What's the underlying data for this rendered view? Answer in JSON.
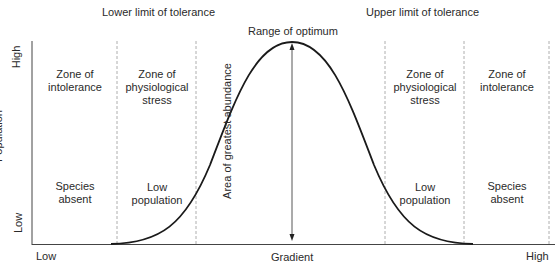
{
  "chart_data": {
    "type": "line",
    "title": "",
    "xlabel": "Gradient",
    "ylabel": "Population",
    "x_ticks": [
      "Low",
      "High"
    ],
    "y_ticks": [
      "Low",
      "High"
    ],
    "grid": false,
    "series": [
      {
        "name": "Population",
        "shape": "bell curve",
        "x": [
          0,
          0.1,
          0.2,
          0.3,
          0.4,
          0.5,
          0.6,
          0.7,
          0.8,
          0.9,
          1.0
        ],
        "y": [
          0,
          0.03,
          0.15,
          0.45,
          0.85,
          1.0,
          0.85,
          0.45,
          0.15,
          0.03,
          0
        ]
      }
    ],
    "zones": [
      {
        "name": "Zone of intolerance",
        "description": "Species absent"
      },
      {
        "name": "Zone of physiological stress",
        "description": "Low population"
      },
      {
        "name": "Range of optimum",
        "description": "Area of greatest abundance"
      },
      {
        "name": "Zone of physiological stress",
        "description": "Low population"
      },
      {
        "name": "Zone of intolerance",
        "description": "Species absent"
      }
    ],
    "annotations": [
      "Lower limit of tolerance",
      "Upper limit of tolerance",
      "Range of optimum",
      "Area of greatest abundance"
    ]
  },
  "header": {
    "lower_limit": "Lower limit of tolerance",
    "upper_limit": "Upper limit of tolerance",
    "optimum": "Range of optimum"
  },
  "axes": {
    "y_label": "Population",
    "y_high": "High",
    "y_low": "Low",
    "x_label": "Gradient",
    "x_low": "Low",
    "x_high": "High"
  },
  "zones": {
    "left_intolerance": {
      "title_1": "Zone of",
      "title_2": "intolerance",
      "desc_1": "Species",
      "desc_2": "absent"
    },
    "left_stress": {
      "title_1": "Zone of",
      "title_2": "physiological",
      "title_3": "stress",
      "desc_1": "Low",
      "desc_2": "population"
    },
    "optimum": {
      "arrow_label": "Area of greatest abundance"
    },
    "right_stress": {
      "title_1": "Zone of",
      "title_2": "physiological",
      "title_3": "stress",
      "desc_1": "Low",
      "desc_2": "population"
    },
    "right_intolerance": {
      "title_1": "Zone of",
      "title_2": "intolerance",
      "desc_1": "Species",
      "desc_2": "absent"
    }
  },
  "colors": {
    "curve": "#1a1a1a",
    "axis": "#444444",
    "dashed": "#999999",
    "text": "#2a2a2a"
  }
}
